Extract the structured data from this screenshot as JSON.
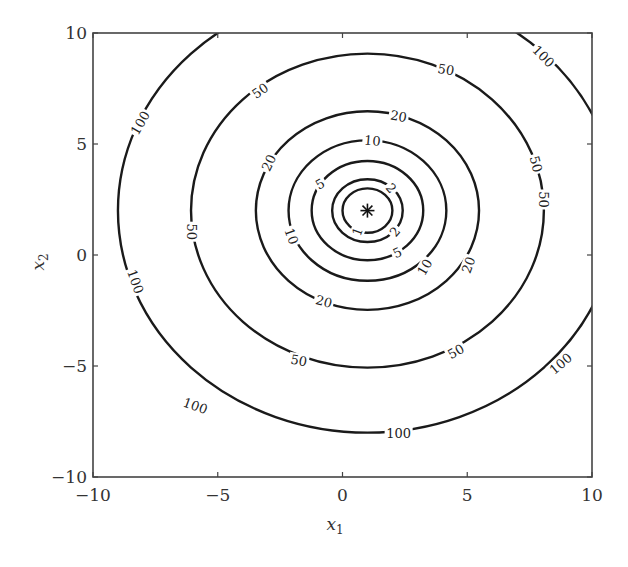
{
  "chart_data": {
    "type": "contour",
    "title": "",
    "xlabel": "x",
    "xlabel_sub": "1",
    "ylabel": "x",
    "ylabel_sub": "2",
    "xlim": [
      -10,
      10
    ],
    "ylim": [
      -10,
      10
    ],
    "xticks": [
      -10,
      -5,
      0,
      5,
      10
    ],
    "yticks": [
      -10,
      -5,
      0,
      5,
      10
    ],
    "xtick_labels": [
      "−10",
      "−5",
      "0",
      "5",
      "10"
    ],
    "ytick_labels": [
      "−10",
      "−5",
      "0",
      "5",
      "10"
    ],
    "grid": false,
    "function": "f(x1, x2) = (x1 - 1)^2 + (x2 - 2)^2",
    "minimum": {
      "x1": 1,
      "x2": 2,
      "marker": "*"
    },
    "levels": [
      1,
      2,
      5,
      10,
      20,
      50,
      100
    ],
    "contour_labels": [
      {
        "level": 1,
        "text": "1",
        "x1": 0.6,
        "x2": 1.05,
        "rot": -70
      },
      {
        "level": 2,
        "text": "2",
        "x1": 1.95,
        "x2": 3.0,
        "rot": 50
      },
      {
        "level": 2,
        "text": "2",
        "x1": 2.1,
        "x2": 1.05,
        "rot": -50
      },
      {
        "level": 5,
        "text": "5",
        "x1": -0.9,
        "x2": 3.2,
        "rot": -30
      },
      {
        "level": 5,
        "text": "5",
        "x1": 2.2,
        "x2": 0.1,
        "rot": -25
      },
      {
        "level": 10,
        "text": "10",
        "x1": 1.2,
        "x2": 5.15,
        "rot": 5
      },
      {
        "level": 10,
        "text": "10",
        "x1": -2.05,
        "x2": 0.85,
        "rot": 70
      },
      {
        "level": 10,
        "text": "10",
        "x1": 3.3,
        "x2": -0.55,
        "rot": -60
      },
      {
        "level": 20,
        "text": "20",
        "x1": 2.25,
        "x2": 6.25,
        "rot": 10
      },
      {
        "level": 20,
        "text": "20",
        "x1": -2.95,
        "x2": 4.15,
        "rot": -65
      },
      {
        "level": 20,
        "text": "20",
        "x1": 5.05,
        "x2": -0.45,
        "rot": -70
      },
      {
        "level": 20,
        "text": "20",
        "x1": -0.75,
        "x2": -2.1,
        "rot": 15
      },
      {
        "level": 50,
        "text": "50",
        "x1": -3.3,
        "x2": 7.4,
        "rot": -35
      },
      {
        "level": 50,
        "text": "50",
        "x1": 4.15,
        "x2": 8.35,
        "rot": 10
      },
      {
        "level": 50,
        "text": "50",
        "x1": 7.75,
        "x2": 4.1,
        "rot": 75
      },
      {
        "level": 50,
        "text": "50",
        "x1": 8.05,
        "x2": 2.5,
        "rot": 90
      },
      {
        "level": 50,
        "text": "50",
        "x1": -6.05,
        "x2": 1.05,
        "rot": 90
      },
      {
        "level": 50,
        "text": "50",
        "x1": -1.75,
        "x2": -4.75,
        "rot": 10
      },
      {
        "level": 50,
        "text": "50",
        "x1": 4.55,
        "x2": -4.35,
        "rot": -30
      },
      {
        "level": 100,
        "text": "100",
        "x1": -8.1,
        "x2": 5.95,
        "rot": -60
      },
      {
        "level": 100,
        "text": "100",
        "x1": -8.3,
        "x2": -1.2,
        "rot": 70
      },
      {
        "level": 100,
        "text": "100",
        "x1": -5.9,
        "x2": -6.8,
        "rot": 20
      },
      {
        "level": 100,
        "text": "100",
        "x1": 2.25,
        "x2": -8.05,
        "rot": 0
      },
      {
        "level": 100,
        "text": "100",
        "x1": 8.05,
        "x2": 8.95,
        "rot": 45
      },
      {
        "level": 100,
        "text": "100",
        "x1": 8.75,
        "x2": -4.9,
        "rot": -40
      }
    ]
  },
  "layout": {
    "plot_left": 93,
    "plot_top": 33,
    "plot_right": 592,
    "plot_bottom": 477
  }
}
